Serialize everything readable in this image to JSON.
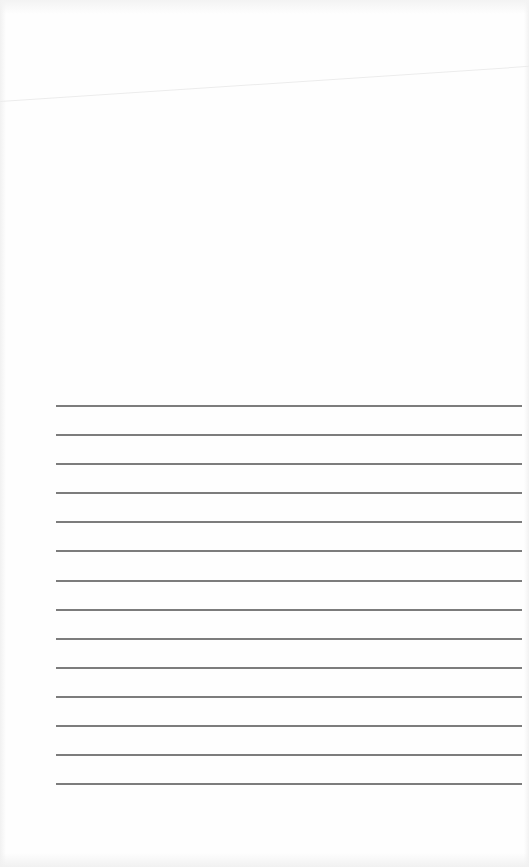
{
  "document": {
    "type": "blank ruled page",
    "ruled_lines": {
      "count": 14,
      "color": "#6e6e6e",
      "entries": [
        "",
        "",
        "",
        "",
        "",
        "",
        "",
        "",
        "",
        "",
        "",
        "",
        "",
        ""
      ]
    }
  }
}
